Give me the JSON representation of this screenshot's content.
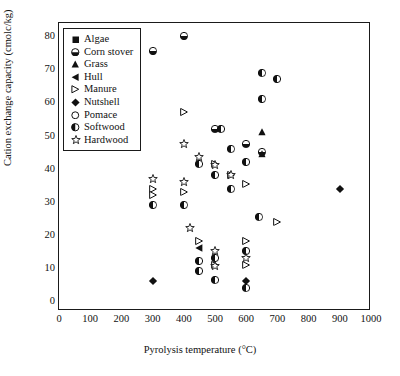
{
  "chart_data": {
    "type": "scatter",
    "title": "",
    "xlabel": "Pyrolysis temperature (°C)",
    "ylabel": "Cation exchange capacity (cmolc/kg)",
    "xlim": [
      0,
      1000
    ],
    "ylim": [
      -3,
      84
    ],
    "xticks": [
      0,
      100,
      200,
      300,
      400,
      500,
      600,
      700,
      800,
      900,
      1000
    ],
    "yticks": [
      0,
      10,
      20,
      30,
      40,
      50,
      60,
      70,
      80
    ],
    "xtick_labels": [
      "0",
      "100",
      "200",
      "300",
      "400",
      "500",
      "600",
      "700",
      "800",
      "900",
      "1000"
    ],
    "ytick_labels": [
      "0",
      "10",
      "20",
      "30",
      "40",
      "50",
      "60",
      "70",
      "80"
    ],
    "grid": false,
    "legend_position": "top-left",
    "series": [
      {
        "name": "Algae",
        "marker": "filled-square",
        "points": []
      },
      {
        "name": "Corn stover",
        "marker": "half-filled-circle-bottom",
        "points": [
          [
            300,
            75.5
          ],
          [
            400,
            80.0
          ],
          [
            500,
            52.0
          ],
          [
            600,
            47.5
          ],
          [
            650,
            45.0
          ]
        ]
      },
      {
        "name": "Grass",
        "marker": "filled-triangle-up",
        "points": [
          [
            650,
            51.0
          ],
          [
            650,
            44.5
          ]
        ]
      },
      {
        "name": "Hull",
        "marker": "filled-triangle-left",
        "points": [
          [
            450,
            16.0
          ]
        ]
      },
      {
        "name": "Manure",
        "marker": "open-triangle-right",
        "points": [
          [
            400,
            57.0
          ],
          [
            300,
            34.0
          ],
          [
            300,
            32.0
          ],
          [
            400,
            33.0
          ],
          [
            500,
            41.5
          ],
          [
            550,
            38.0
          ],
          [
            600,
            35.5
          ],
          [
            700,
            24.0
          ],
          [
            450,
            18.0
          ],
          [
            600,
            18.0
          ],
          [
            500,
            11.0
          ],
          [
            600,
            11.0
          ]
        ]
      },
      {
        "name": "Nutshell",
        "marker": "filled-diamond",
        "points": [
          [
            300,
            6.0
          ],
          [
            600,
            6.0
          ],
          [
            900,
            34.0
          ]
        ]
      },
      {
        "name": "Pomace",
        "marker": "open-circle",
        "points": []
      },
      {
        "name": "Softwood",
        "marker": "half-filled-circle-left",
        "points": [
          [
            650,
            69.0
          ],
          [
            700,
            67.0
          ],
          [
            650,
            61.0
          ],
          [
            520,
            52.0
          ],
          [
            550,
            46.0
          ],
          [
            600,
            42.0
          ],
          [
            300,
            29.0
          ],
          [
            400,
            29.0
          ],
          [
            450,
            41.5
          ],
          [
            500,
            38.0
          ],
          [
            550,
            34.0
          ],
          [
            450,
            12.0
          ],
          [
            450,
            9.0
          ],
          [
            500,
            13.0
          ],
          [
            500,
            6.5
          ],
          [
            600,
            15.0
          ],
          [
            600,
            4.0
          ],
          [
            640,
            25.5
          ]
        ]
      },
      {
        "name": "Hardwood",
        "marker": "open-star",
        "points": [
          [
            400,
            47.5
          ],
          [
            300,
            37.0
          ],
          [
            400,
            36.0
          ],
          [
            450,
            43.5
          ],
          [
            500,
            41.0
          ],
          [
            550,
            38.0
          ],
          [
            420,
            22.0
          ],
          [
            500,
            15.0
          ],
          [
            500,
            10.5
          ],
          [
            600,
            13.0
          ]
        ]
      }
    ]
  }
}
